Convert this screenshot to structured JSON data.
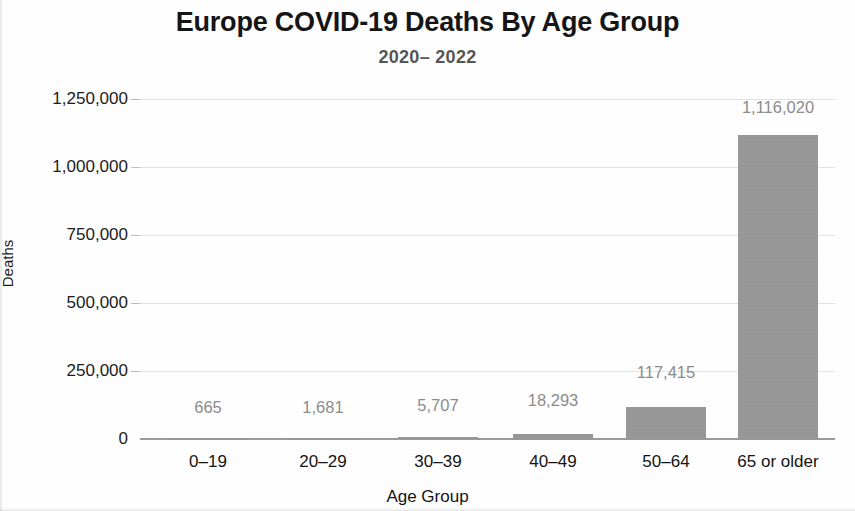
{
  "chart_data": {
    "type": "bar",
    "title": "Europe COVID-19 Deaths By Age Group",
    "subtitle": "2020– 2022",
    "xlabel": "Age Group",
    "ylabel": "Deaths",
    "categories": [
      "0–19",
      "20–29",
      "30–39",
      "40–49",
      "50–64",
      "65 or older"
    ],
    "values": [
      665,
      1681,
      5707,
      18293,
      117415,
      1116020
    ],
    "value_labels": [
      "665",
      "1,681",
      "5,707",
      "18,293",
      "117,415",
      "1,116,020"
    ],
    "ylim": [
      0,
      1250000
    ],
    "ytick_values": [
      1250000,
      1000000,
      750000,
      500000,
      250000,
      0
    ],
    "ytick_labels": [
      "1,250,000",
      "1,000,000",
      "750,000",
      "500,000",
      "250,000",
      "0"
    ],
    "grid": true,
    "legend": false,
    "bar_color": "#989898",
    "label_color": "#8c8c8c",
    "gridline_color": "#e3e3e3",
    "axis_color": "#9a9a9a",
    "title_color": "#151515",
    "subtitle_color": "#565656"
  }
}
